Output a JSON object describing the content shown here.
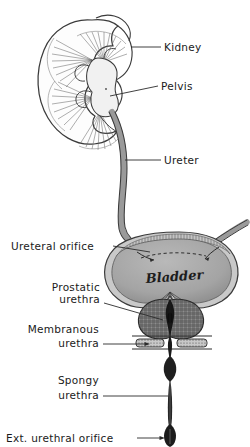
{
  "figure": {
    "background_color": "#ffffff",
    "ink_color": "#2b2b2b",
    "fill_gray": "#9a9a9a",
    "style": "hand-drawn anatomical line illustration"
  },
  "labels": {
    "kidney": "Kidney",
    "pelvis": "Pelvis",
    "ureter": "Ureter",
    "ureteral_orifice": "Ureteral orifice",
    "bladder": "Bladder",
    "prostatic_urethra_line1": "Prostatic",
    "prostatic_urethra_line2": "urethra",
    "membranous_urethra_line1": "Membranous",
    "membranous_urethra_line2": "urethra",
    "spongy_urethra_line1": "Spongy",
    "spongy_urethra_line2": "urethra",
    "ext_urethral_orifice": "Ext. urethral orifice"
  },
  "structures": [
    {
      "name": "kidney",
      "label": "Kidney",
      "fill": "#ffffff",
      "outline": "#3a3a3a"
    },
    {
      "name": "renal-pelvis",
      "label": "Pelvis",
      "fill": "#efefef",
      "outline": "#3a3a3a"
    },
    {
      "name": "ureter",
      "label": "Ureter",
      "fill": "#9a9a9a",
      "outline": "#3a3a3a"
    },
    {
      "name": "bladder",
      "label": "Bladder",
      "fill": "#a8a8a8",
      "outline": "#3a3a3a"
    },
    {
      "name": "prostate",
      "label": "Prostatic urethra",
      "fill": "#6f6f6f",
      "outline": "#2b2b2b"
    },
    {
      "name": "urogenital-diaphragm",
      "label": "Membranous urethra",
      "fill": "#b4b4b4",
      "outline": "#2b2b2b"
    },
    {
      "name": "penile-shaft",
      "label": "Spongy urethra",
      "fill": "#232323",
      "outline": "#141414"
    },
    {
      "name": "glans",
      "label": "Ext. urethral orifice",
      "fill": "#232323",
      "outline": "#141414"
    }
  ]
}
